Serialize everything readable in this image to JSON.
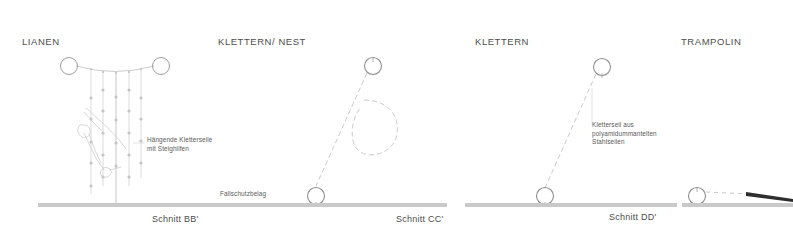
{
  "document": {
    "kind": "architectural-section-drawings",
    "background_color": "#ffffff",
    "line_color": "#b3b3b3",
    "ground_color": "#c9c9c9",
    "text_color": "#4d4d4d"
  },
  "panels": [
    {
      "id": "lianen",
      "title": "LIANEN",
      "caption": "Schnitt BB'",
      "annotation": "Hängende Kletterseile\nmit Steighilfen",
      "annotation_line1": "Hängende Kletterseile",
      "annotation_line2": "mit Steighilfen",
      "elements": [
        "post-left",
        "post-right",
        "catenary-cable",
        "hanging-rope-1",
        "hanging-rope-2",
        "hanging-rope-3",
        "hanging-rope-4",
        "hanging-rope-5",
        "climbing-figure",
        "ground-bar"
      ]
    },
    {
      "id": "klettern-nest",
      "title": "KLETTERN/ NEST",
      "caption": "Schnitt CC'",
      "annotation": "Fallschutzbelag",
      "annotation_line1": "Fallschutzbelag",
      "elements": [
        "top-anchor-circle",
        "bottom-anchor-circle",
        "diagonal-rope",
        "nest-loop",
        "ground-bar"
      ]
    },
    {
      "id": "klettern",
      "title": "KLETTERN",
      "caption": "Schnitt DD'",
      "annotation_line1": "Kletterseil  aus",
      "annotation_line2": "polyamidummantelten",
      "annotation_line3": "Stahlseilen",
      "elements": [
        "top-anchor-circle",
        "bottom-anchor-circle",
        "diagonal-rope",
        "leader-line",
        "ground-bar"
      ]
    },
    {
      "id": "trampolin",
      "title": "TRAMPOLIN",
      "caption": "",
      "elements": [
        "anchor-circle",
        "trampoline-surface-dotted",
        "trampoline-wedge",
        "ground-bar"
      ]
    }
  ]
}
